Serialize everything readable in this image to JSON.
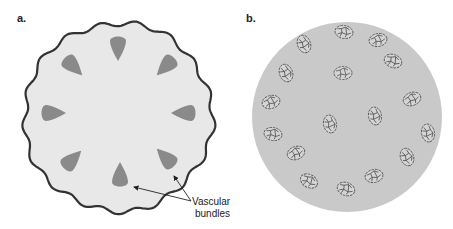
{
  "figure": {
    "panel_a": {
      "label": "a.",
      "description": "Dicot stem cross-section with vascular bundles in a ring",
      "outline_color": "#333333",
      "fill_color": "#e8e8e8",
      "bundle_color": "#8a8a8a",
      "center": [
        118,
        117
      ],
      "radius": 94,
      "bundles": [
        {
          "x": 118,
          "y": 48,
          "angle": 0
        },
        {
          "x": 166,
          "y": 66,
          "angle": 45
        },
        {
          "x": 184,
          "y": 113,
          "angle": 90
        },
        {
          "x": 166,
          "y": 158,
          "angle": 135
        },
        {
          "x": 120,
          "y": 175,
          "angle": 180
        },
        {
          "x": 72,
          "y": 160,
          "angle": 225
        },
        {
          "x": 53,
          "y": 113,
          "angle": 270
        },
        {
          "x": 73,
          "y": 66,
          "angle": 315
        }
      ],
      "annotation": {
        "line1": "Vascular",
        "line2": "bundles"
      }
    },
    "panel_b": {
      "label": "b.",
      "description": "Monocot stem cross-section with scattered vascular bundles",
      "fill_color": "#c9c9c9",
      "bundle_stroke": "#555555",
      "center": [
        347,
        117
      ],
      "radius": 95,
      "bundles": [
        {
          "x": 344,
          "y": 32,
          "rot": 10
        },
        {
          "x": 378,
          "y": 40,
          "rot": -10
        },
        {
          "x": 304,
          "y": 44,
          "rot": 70
        },
        {
          "x": 393,
          "y": 61,
          "rot": 20
        },
        {
          "x": 286,
          "y": 73,
          "rot": 70
        },
        {
          "x": 343,
          "y": 73,
          "rot": 0
        },
        {
          "x": 271,
          "y": 102,
          "rot": -15
        },
        {
          "x": 412,
          "y": 99,
          "rot": -20
        },
        {
          "x": 375,
          "y": 116,
          "rot": 80
        },
        {
          "x": 330,
          "y": 124,
          "rot": 80
        },
        {
          "x": 428,
          "y": 133,
          "rot": 80
        },
        {
          "x": 273,
          "y": 134,
          "rot": 10
        },
        {
          "x": 296,
          "y": 153,
          "rot": -20
        },
        {
          "x": 407,
          "y": 157,
          "rot": 70
        },
        {
          "x": 374,
          "y": 176,
          "rot": -10
        },
        {
          "x": 309,
          "y": 181,
          "rot": 30
        },
        {
          "x": 346,
          "y": 189,
          "rot": 20
        }
      ]
    }
  }
}
